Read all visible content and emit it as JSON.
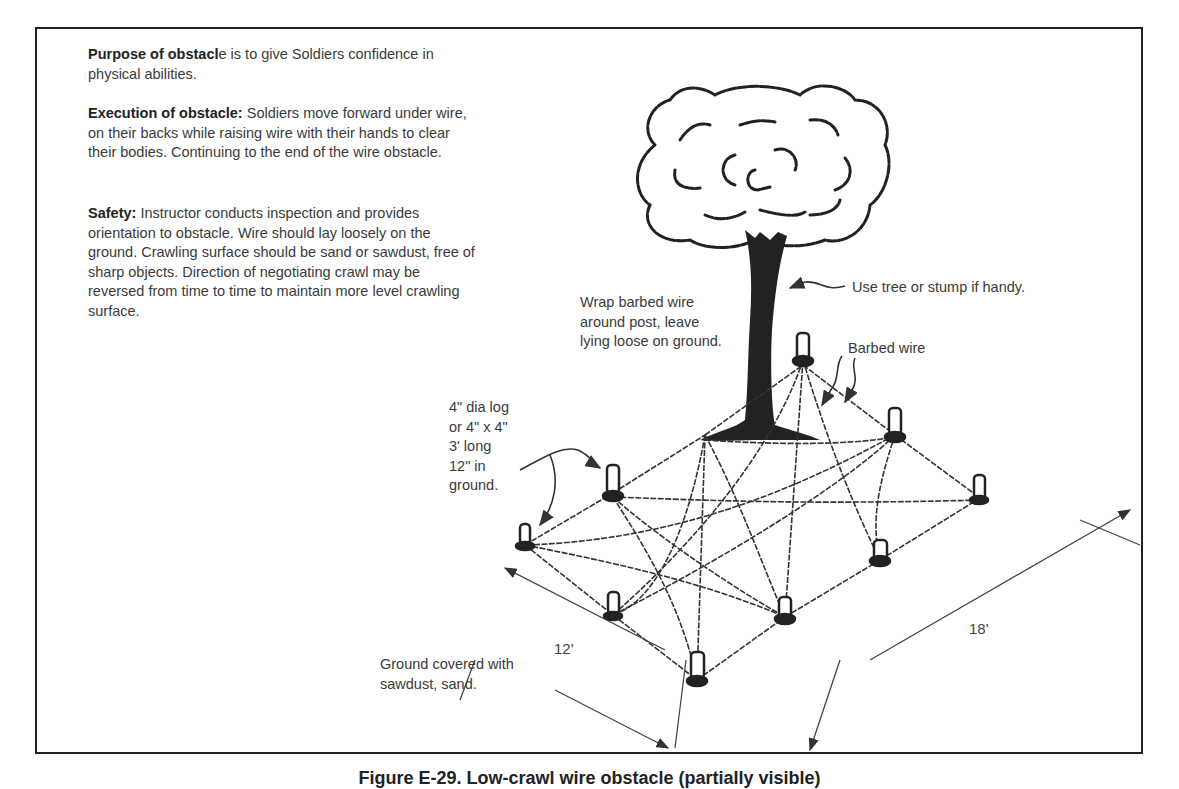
{
  "text_blocks": {
    "purpose": {
      "heading": "Purpose of obstacl",
      "heading_tail": "e is to give Soldiers confidence in physical abilities."
    },
    "execution": {
      "heading": "Execution of obstacle:",
      "body": " Soldiers move forward under wire, on their backs while raising wire with their hands to clear their bodies.  Continuing to the end of the wire obstacle."
    },
    "safety": {
      "heading": "Safety:",
      "body": " Instructor conducts inspection and provides orientation to obstacle.  Wire should lay loosely on the ground.  Crawling surface should be sand or sawdust, free of sharp objects.  Direction of negotiating crawl may be reversed from time to time to maintain more level crawling surface."
    }
  },
  "annotations": {
    "tree": "Use tree or stump if handy.",
    "wrap": [
      "Wrap barbed wire",
      "around post, leave",
      "lying loose on ground."
    ],
    "barbed_wire": "Barbed wire",
    "post": [
      "4\" dia log",
      "or 4\" x 4\"",
      "3' long",
      "12\" in",
      "ground."
    ],
    "ground": [
      "Ground covered with",
      "sawdust, sand."
    ]
  },
  "dimensions": {
    "width": "12'",
    "length": "18'"
  },
  "caption": "Figure E-29. Low-crawl wire obstacle (partially visible)"
}
